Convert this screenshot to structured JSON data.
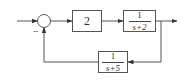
{
  "diagram": {
    "type": "negative feedback control loop",
    "input_label": "",
    "output_label": "",
    "summing_junction": {
      "signs": {
        "feedback": "−"
      }
    },
    "forward_blocks": [
      {
        "label": "2"
      },
      {
        "numerator": "1",
        "denominator": "s+2"
      }
    ],
    "feedback_block": {
      "numerator": "1",
      "denominator": "s+5"
    },
    "line_color": "#555555"
  }
}
